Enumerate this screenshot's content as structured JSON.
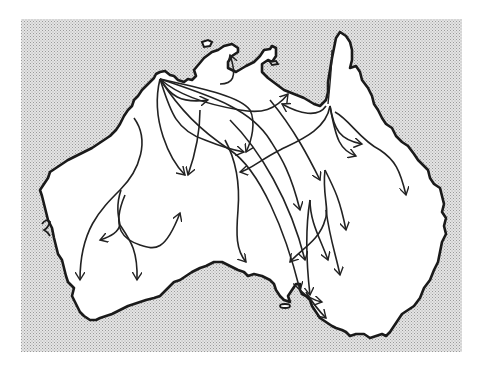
{
  "figure": {
    "type": "map",
    "content": "Hand-drawn outline of the Australian continent on a stippled sea background, with curved arrows showing dispersal routes radiating from the north-west coast across the continent",
    "colors": {
      "page_background": "#ffffff",
      "sea_stipple_light": "#e6e6e6",
      "sea_stipple_dark": "#a8a8a8",
      "land_fill": "#ffffff",
      "coastline": "#1a1a1a",
      "arrows": "#222222"
    },
    "frame": {
      "x": 21,
      "y": 19,
      "width": 441,
      "height": 333
    },
    "origin_point": {
      "x": 160,
      "y": 79,
      "description": "north-west coast, primary origin of arrows"
    },
    "secondary_origin": {
      "x": 330,
      "y": 100,
      "description": "Gulf of Carpentaria / Cape York base, secondary origin"
    },
    "arrow_count": 28,
    "labels": []
  }
}
